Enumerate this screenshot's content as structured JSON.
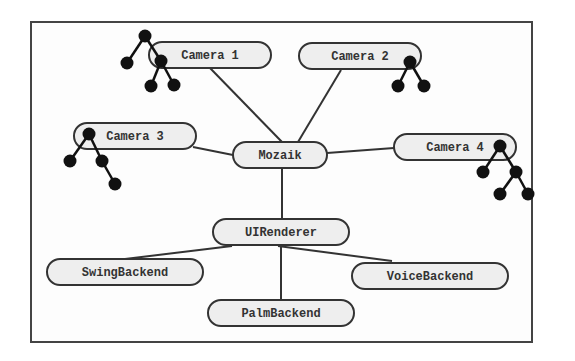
{
  "diagram": {
    "nodes": [
      {
        "id": "camera1",
        "label": "Camera 1",
        "cx": 210,
        "cy": 55,
        "rx": 61,
        "ry": 13
      },
      {
        "id": "camera2",
        "label": "Camera 2",
        "cx": 360,
        "cy": 56,
        "rx": 61,
        "ry": 13
      },
      {
        "id": "camera3",
        "label": "Camera 3",
        "cx": 135,
        "cy": 136,
        "rx": 61,
        "ry": 13
      },
      {
        "id": "camera4",
        "label": "Camera 4",
        "cx": 455,
        "cy": 147,
        "rx": 61,
        "ry": 13
      },
      {
        "id": "mozaik",
        "label": "Mozaik",
        "cx": 280,
        "cy": 155,
        "rx": 47,
        "ry": 13
      },
      {
        "id": "uirenderer",
        "label": "UIRenderer",
        "cx": 281,
        "cy": 232,
        "rx": 68,
        "ry": 13
      },
      {
        "id": "swingbackend",
        "label": "SwingBackend",
        "cx": 125,
        "cy": 272,
        "rx": 78,
        "ry": 13
      },
      {
        "id": "voicebackend",
        "label": "VoiceBackend",
        "cx": 430,
        "cy": 276,
        "rx": 78,
        "ry": 13
      },
      {
        "id": "palmbackend",
        "label": "PalmBackend",
        "cx": 281,
        "cy": 313,
        "rx": 73,
        "ry": 13
      }
    ],
    "edges": [
      {
        "from": "camera1",
        "to": "mozaik",
        "x1": 210,
        "y1": 68,
        "x2": 282,
        "y2": 142
      },
      {
        "from": "camera2",
        "to": "mozaik",
        "x1": 341,
        "y1": 70,
        "x2": 298,
        "y2": 142
      },
      {
        "from": "camera3",
        "to": "mozaik",
        "x1": 193,
        "y1": 147,
        "x2": 233,
        "y2": 155
      },
      {
        "from": "camera4",
        "to": "mozaik",
        "x1": 394,
        "y1": 148,
        "x2": 327,
        "y2": 153
      },
      {
        "from": "mozaik",
        "to": "uirenderer",
        "x1": 282,
        "y1": 168,
        "x2": 282,
        "y2": 219
      },
      {
        "from": "uirenderer",
        "to": "swingbackend",
        "x1": 232,
        "y1": 246,
        "x2": 125,
        "y2": 259
      },
      {
        "from": "uirenderer",
        "to": "voicebackend",
        "x1": 278,
        "y1": 246,
        "x2": 392,
        "y2": 261
      },
      {
        "from": "uirenderer",
        "to": "palmbackend",
        "x1": 281,
        "y1": 245,
        "x2": 281,
        "y2": 300
      }
    ],
    "trees": [
      {
        "attached_to": "camera1",
        "dots": [
          [
            145,
            36
          ],
          [
            127,
            63
          ],
          [
            161,
            61
          ],
          [
            151,
            86
          ],
          [
            174,
            85
          ]
        ],
        "links": [
          [
            0,
            1
          ],
          [
            0,
            2
          ],
          [
            2,
            3
          ],
          [
            2,
            4
          ]
        ]
      },
      {
        "attached_to": "camera2",
        "dots": [
          [
            410,
            62
          ],
          [
            398,
            86
          ],
          [
            424,
            86
          ]
        ],
        "links": [
          [
            0,
            1
          ],
          [
            0,
            2
          ]
        ]
      },
      {
        "attached_to": "camera3",
        "dots": [
          [
            89,
            134
          ],
          [
            70,
            161
          ],
          [
            102,
            161
          ],
          [
            115,
            184
          ]
        ],
        "links": [
          [
            0,
            1
          ],
          [
            0,
            2
          ],
          [
            2,
            3
          ]
        ]
      },
      {
        "attached_to": "camera4",
        "dots": [
          [
            500,
            146
          ],
          [
            483,
            172
          ],
          [
            516,
            172
          ],
          [
            500,
            194
          ],
          [
            528,
            194
          ]
        ],
        "links": [
          [
            0,
            1
          ],
          [
            0,
            2
          ],
          [
            2,
            3
          ],
          [
            2,
            4
          ]
        ]
      }
    ]
  }
}
